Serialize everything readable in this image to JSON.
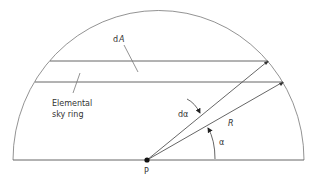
{
  "diagram": {
    "labels": {
      "dA": "dA",
      "d_prefix": "d",
      "A": "A",
      "elemental_line1": "Elemental",
      "elemental_line2": "sky ring",
      "dalpha": "dα",
      "R": "R",
      "alpha": "α",
      "P": "P"
    },
    "elements": [
      "hemisphere-outline",
      "ground-baseline",
      "observer-point-P",
      "ring-upper-edge",
      "ring-lower-edge",
      "ray-upper",
      "ray-lower",
      "dalpha-arrow",
      "alpha-arc-arrow",
      "dA-leader",
      "elemental-ring-leader"
    ],
    "colors": {
      "line": "#555555",
      "text": "#333333",
      "background": "#ffffff"
    }
  }
}
